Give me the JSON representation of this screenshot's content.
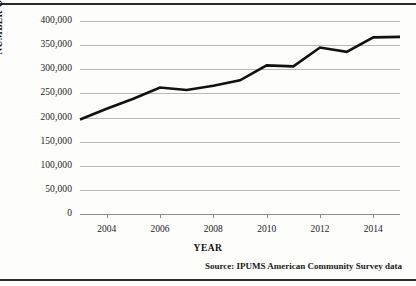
{
  "chart_data": {
    "type": "line",
    "title": "",
    "xlabel": "YEAR",
    "ylabel": "NUMBER OF AMERICANS",
    "x": [
      2003,
      2004,
      2005,
      2006,
      2007,
      2008,
      2009,
      2010,
      2011,
      2012,
      2013,
      2014,
      2015
    ],
    "values": [
      196000,
      218000,
      239000,
      262000,
      257000,
      266000,
      277000,
      308000,
      306000,
      345000,
      336000,
      366000,
      367000
    ],
    "series": [
      {
        "name": "Number of Americans",
        "values": [
          196000,
          218000,
          239000,
          262000,
          257000,
          266000,
          277000,
          308000,
          306000,
          345000,
          336000,
          366000,
          367000
        ]
      }
    ],
    "xlim": [
      2003,
      2015
    ],
    "ylim": [
      0,
      400000
    ],
    "ytick_values": [
      400000,
      350000,
      300000,
      250000,
      200000,
      150000,
      100000,
      50000,
      0
    ],
    "ytick_labels": [
      "400,000",
      "350,000",
      "300,000",
      "250,000",
      "200,000",
      "150,000",
      "100,000",
      "50,000",
      "0"
    ],
    "xtick_values": [
      2004,
      2006,
      2008,
      2010,
      2012,
      2014
    ],
    "xtick_labels": [
      "2004",
      "2006",
      "2008",
      "2010",
      "2012",
      "2014"
    ],
    "grid": "horizontal",
    "legend": "none",
    "line_color": "#111111",
    "gridline_color": "#b9b9b9",
    "axis_color": "#8e8e8e"
  },
  "source_note": "Source:  IPUMS American Community Survey data",
  "colors": {
    "background": "#fdfdfc",
    "rule": "#2b2b2b",
    "text": "#1c1c1c"
  }
}
